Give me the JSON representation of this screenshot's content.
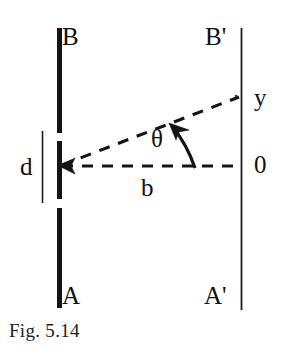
{
  "figure": {
    "caption": "Fig. 5.14",
    "kind": "optics-single-slit-diffraction-geometry",
    "canvas": {
      "width": 285,
      "height": 350,
      "background": "#ffffff"
    },
    "ink_color": "#141414"
  },
  "labels": {
    "barrier_top": "B",
    "barrier_bottom": "A",
    "screen_top": "B'",
    "screen_bottom": "A'",
    "slit_width": "d",
    "screen_distance": "b",
    "angle": "θ",
    "fringe_position": "y",
    "origin": "0"
  },
  "geometry": {
    "barrier_x": 58,
    "barrier_thickness": 5,
    "barrier_segments": [
      {
        "name": "upper-plate",
        "y1": 28,
        "y2": 133
      },
      {
        "name": "slit-jaw-middle",
        "y1": 141,
        "y2": 199
      },
      {
        "name": "lower-plate",
        "y1": 208,
        "y2": 308
      }
    ],
    "slit_measure_line": {
      "x": 42,
      "y1": 131,
      "y2": 203
    },
    "screen_line": {
      "x": 241,
      "y1": 28,
      "y2": 310
    },
    "axis_dashed": {
      "x1": 60,
      "y1": 166,
      "x2": 240,
      "y2": 166
    },
    "ray_dashed": {
      "x1": 60,
      "y1": 166,
      "x2": 239,
      "y2": 97
    },
    "angle_arc": {
      "cx": 60,
      "cy": 166,
      "radius": 132,
      "from_deg": 0,
      "to_deg": 21
    },
    "arrowhead_at_slit": {
      "x": 60,
      "y": 166,
      "direction": "left"
    },
    "arrowhead_on_arc": {
      "x": 170,
      "y": 125,
      "direction": "upper-left"
    }
  }
}
